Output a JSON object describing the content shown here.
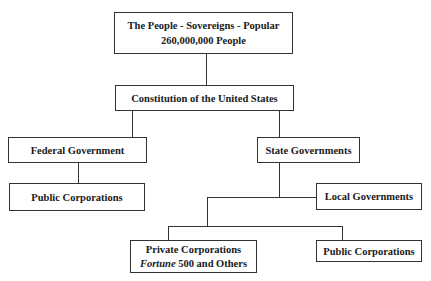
{
  "diagram": {
    "people": {
      "line1": "The People - Sovereigns - Popular",
      "line2": "260,000,000 People"
    },
    "constitution": "Constitution of the United States",
    "federal": "Federal Government",
    "federal_public_corporations": "Public Corporations",
    "state": "State Governments",
    "local": "Local Governments",
    "private": {
      "line1": "Private Corporations",
      "line2_italic": "Fortune",
      "line2_rest": " 500 and Others"
    },
    "local_public_corporations": "Public Corporations"
  }
}
